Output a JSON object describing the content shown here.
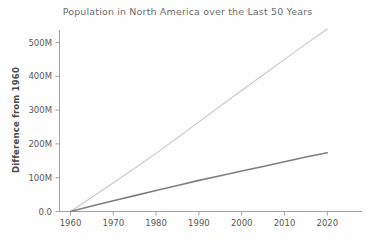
{
  "chart_data": {
    "type": "line",
    "title": "Population in North America over the Last 50 Years",
    "xlabel": "",
    "ylabel": "Difference from 1960",
    "xlim": [
      1957,
      2026
    ],
    "ylim": [
      0,
      560000000
    ],
    "grid": false,
    "legend": "none",
    "xticks": [
      1960,
      1970,
      1980,
      1990,
      2000,
      2010,
      2020
    ],
    "xticklabels": [
      "1960",
      "1970",
      "1980",
      "1990",
      "2000",
      "2010",
      "2020"
    ],
    "yticks": [
      0,
      100000000,
      200000000,
      300000000,
      400000000,
      500000000
    ],
    "yticklabels": [
      "0.0",
      "100M",
      "200M",
      "300M",
      "400M",
      "500M"
    ],
    "x": [
      1960,
      1965,
      1970,
      1975,
      1980,
      1985,
      1990,
      1995,
      2000,
      2005,
      2010,
      2015,
      2020
    ],
    "series": [
      {
        "name": "light-series",
        "color": "#c9c9c9",
        "linewidth": 1.1,
        "values": [
          0,
          42000000,
          85000000,
          128000000,
          172000000,
          218000000,
          265000000,
          312000000,
          358000000,
          404000000,
          450000000,
          496000000,
          540000000
        ]
      },
      {
        "name": "dark-series",
        "color": "#7f7f7f",
        "linewidth": 1.6,
        "values": [
          0,
          16000000,
          32000000,
          47000000,
          62000000,
          77000000,
          92000000,
          106000000,
          120000000,
          133000000,
          147000000,
          161000000,
          174000000
        ]
      }
    ]
  },
  "figure": {
    "title": "Population in North America over the Last 50 Years",
    "ylabel": "Difference from 1960",
    "background_color": "#fefefe",
    "axis_color": "#9a9a9a",
    "title_color": "#6e6e6e",
    "tick_color": "#5a5a5a"
  },
  "ytick_labels": [
    "500M",
    "400M",
    "300M",
    "200M",
    "100M",
    "0.0"
  ],
  "xtick_labels": [
    "1960",
    "1970",
    "1980",
    "1990",
    "2000",
    "2010",
    "2020"
  ]
}
